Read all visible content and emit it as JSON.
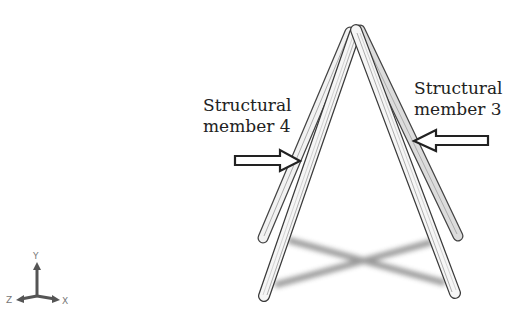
{
  "diagram": {
    "labels": [
      {
        "id": "member-4",
        "line1": "Structural",
        "line2": "member 4"
      },
      {
        "id": "member-3",
        "line1": "Structural",
        "line2": "member 3"
      }
    ],
    "axes": {
      "y": "Y",
      "z": "Z",
      "x": "X"
    }
  }
}
